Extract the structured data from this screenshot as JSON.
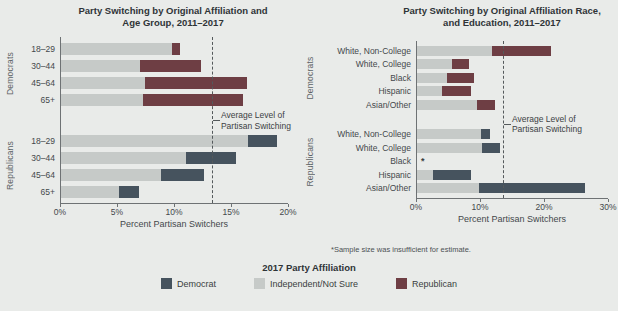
{
  "figure": {
    "footnote": "*Sample size was insufficient for estimate.",
    "legend": {
      "title": "2017 Party Affiliation",
      "items": [
        {
          "label": "Democrat",
          "color_key": "democrat"
        },
        {
          "label": "Independent/Not Sure",
          "color_key": "independent"
        },
        {
          "label": "Republican",
          "color_key": "republican"
        }
      ]
    },
    "colors": {
      "democrat": "#46535e",
      "independent": "#c6cac8",
      "republican": "#6e3e44",
      "background": "#e9ebe9",
      "axis": "#6e7274"
    }
  },
  "chart_data": [
    {
      "type": "bar",
      "orientation": "horizontal-stacked",
      "title_lines": [
        "Party Switching by Original Affiliation and",
        "Age Group, 2011–2017"
      ],
      "xlabel": "Percent Partisan Switchers",
      "x_ticks": [
        "0%",
        "5%",
        "10%",
        "15%",
        "20%"
      ],
      "xlim": [
        0,
        20
      ],
      "grid": false,
      "average_line": {
        "value": 13.3,
        "label_lines": [
          "Average Level of",
          "Partisan Switching"
        ]
      },
      "groups": [
        {
          "label": "Democrats",
          "rows": [
            {
              "label": "18–29",
              "segments": [
                {
                  "affiliation": "independent",
                  "value": 9.8
                },
                {
                  "affiliation": "republican",
                  "value": 0.7
                }
              ]
            },
            {
              "label": "30–44",
              "segments": [
                {
                  "affiliation": "independent",
                  "value": 7.0
                },
                {
                  "affiliation": "republican",
                  "value": 5.3
                }
              ]
            },
            {
              "label": "45–64",
              "segments": [
                {
                  "affiliation": "independent",
                  "value": 7.4
                },
                {
                  "affiliation": "republican",
                  "value": 9.0
                }
              ]
            },
            {
              "label": "65+",
              "segments": [
                {
                  "affiliation": "independent",
                  "value": 7.2
                },
                {
                  "affiliation": "republican",
                  "value": 8.8
                }
              ]
            }
          ]
        },
        {
          "label": "Republicans",
          "rows": [
            {
              "label": "18–29",
              "segments": [
                {
                  "affiliation": "independent",
                  "value": 16.5
                },
                {
                  "affiliation": "democrat",
                  "value": 2.5
                }
              ]
            },
            {
              "label": "30–44",
              "segments": [
                {
                  "affiliation": "independent",
                  "value": 11.0
                },
                {
                  "affiliation": "democrat",
                  "value": 4.4
                }
              ]
            },
            {
              "label": "45–64",
              "segments": [
                {
                  "affiliation": "independent",
                  "value": 8.8
                },
                {
                  "affiliation": "democrat",
                  "value": 3.8
                }
              ]
            },
            {
              "label": "65+",
              "segments": [
                {
                  "affiliation": "independent",
                  "value": 5.1
                },
                {
                  "affiliation": "democrat",
                  "value": 1.8
                }
              ]
            }
          ]
        }
      ]
    },
    {
      "type": "bar",
      "orientation": "horizontal-stacked",
      "title_lines": [
        "Party Switching by Original Affiliation Race,",
        "and Education, 2011–2017"
      ],
      "xlabel": "Percent Partisan Switchers",
      "x_ticks": [
        "0%",
        "10%",
        "20%",
        "30%"
      ],
      "xlim": [
        0,
        30
      ],
      "grid": false,
      "average_line": {
        "value": 13.5,
        "label_lines": [
          "Average Level of",
          "Partisan Switching"
        ]
      },
      "groups": [
        {
          "label": "Democrats",
          "rows": [
            {
              "label": "White, Non-College",
              "segments": [
                {
                  "affiliation": "independent",
                  "value": 11.8
                },
                {
                  "affiliation": "republican",
                  "value": 9.2
                }
              ]
            },
            {
              "label": "White, College",
              "segments": [
                {
                  "affiliation": "independent",
                  "value": 5.5
                },
                {
                  "affiliation": "republican",
                  "value": 2.6
                }
              ]
            },
            {
              "label": "Black",
              "segments": [
                {
                  "affiliation": "independent",
                  "value": 4.7
                },
                {
                  "affiliation": "republican",
                  "value": 4.3
                }
              ]
            },
            {
              "label": "Hispanic",
              "segments": [
                {
                  "affiliation": "independent",
                  "value": 3.9
                },
                {
                  "affiliation": "republican",
                  "value": 4.6
                }
              ]
            },
            {
              "label": "Asian/Other",
              "segments": [
                {
                  "affiliation": "independent",
                  "value": 9.5
                },
                {
                  "affiliation": "republican",
                  "value": 2.8
                }
              ]
            }
          ]
        },
        {
          "label": "Republicans",
          "rows": [
            {
              "label": "White, Non-College",
              "segments": [
                {
                  "affiliation": "independent",
                  "value": 10.0
                },
                {
                  "affiliation": "democrat",
                  "value": 1.5
                }
              ]
            },
            {
              "label": "White, College",
              "segments": [
                {
                  "affiliation": "independent",
                  "value": 10.2
                },
                {
                  "affiliation": "democrat",
                  "value": 2.8
                }
              ]
            },
            {
              "label": "Black",
              "segments": [],
              "note": "*"
            },
            {
              "label": "Hispanic",
              "segments": [
                {
                  "affiliation": "independent",
                  "value": 2.5
                },
                {
                  "affiliation": "democrat",
                  "value": 6.0
                }
              ]
            },
            {
              "label": "Asian/Other",
              "segments": [
                {
                  "affiliation": "independent",
                  "value": 9.8
                },
                {
                  "affiliation": "democrat",
                  "value": 16.6
                }
              ]
            }
          ]
        }
      ]
    }
  ]
}
